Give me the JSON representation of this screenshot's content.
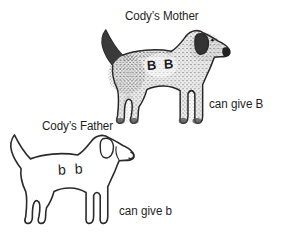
{
  "figure": {
    "background_color": "#ffffff",
    "ink_color": "#1e1e1e",
    "mother": {
      "label": "Cody’s Mother",
      "alleles": "B B",
      "caption": "can give B",
      "illustration": "shaded-dog-side-profile"
    },
    "father": {
      "label": "Cody’s Father",
      "alleles": "b b",
      "caption": "can give b",
      "illustration": "outline-dog-side-profile"
    }
  }
}
